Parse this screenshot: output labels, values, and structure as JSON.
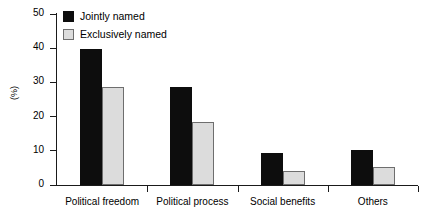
{
  "chart_data": {
    "type": "bar",
    "title": "",
    "xlabel": "",
    "ylabel": "(%)",
    "ylim": [
      0,
      50
    ],
    "yticks": [
      0,
      10,
      20,
      30,
      40,
      50
    ],
    "grid": false,
    "legend_position": "top-left",
    "categories": [
      "Political freedom",
      "Political process",
      "Social benefits",
      "Others"
    ],
    "series": [
      {
        "name": "Jointly named",
        "color": "#0d0d0d",
        "values": [
          39.8,
          28.8,
          9.3,
          10.3
        ]
      },
      {
        "name": "Exclusively named",
        "color": "#dcdcdc",
        "values": [
          28.7,
          18.4,
          4.1,
          5.3
        ]
      }
    ]
  },
  "axis": {
    "y_label": "(%)",
    "tick_labels": [
      "50",
      "40",
      "30",
      "20",
      "10",
      "0"
    ]
  },
  "legend": {
    "items": [
      {
        "label": "Jointly named"
      },
      {
        "label": "Exclusively named"
      }
    ]
  },
  "categories": [
    {
      "label": "Political freedom"
    },
    {
      "label": "Political process"
    },
    {
      "label": "Social benefits"
    },
    {
      "label": "Others"
    }
  ]
}
